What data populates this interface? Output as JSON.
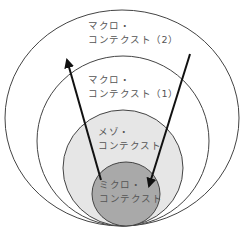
{
  "diagram": {
    "type": "nested-circles",
    "circles": [
      {
        "id": "macro-2",
        "label_line1": "マクロ・",
        "label_line2": "コンテクスト（2）",
        "fill": "#ffffff",
        "stroke": "#333333"
      },
      {
        "id": "macro-1",
        "label_line1": "マクロ・",
        "label_line2": "コンテクスト（1）",
        "fill": "#ffffff",
        "stroke": "#333333"
      },
      {
        "id": "meso",
        "label_line1": "メゾ・",
        "label_line2": "コンテクスト",
        "fill": "#e6e6e6",
        "stroke": "#333333"
      },
      {
        "id": "micro",
        "label_line1": "ミクロ・",
        "label_line2": "コンテクスト",
        "fill": "#a9a9a9",
        "stroke": "#333333"
      }
    ],
    "arrows": [
      {
        "id": "upward-arrow",
        "from": "micro",
        "to": "macro-2",
        "direction": "outward"
      },
      {
        "id": "downward-arrow",
        "from": "macro-2",
        "to": "micro",
        "direction": "inward"
      }
    ],
    "colors": {
      "line": "#333333",
      "arrow": "#111111",
      "text": "#555555"
    }
  }
}
